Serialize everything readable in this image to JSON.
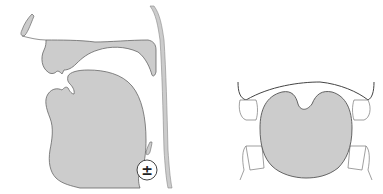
{
  "diagram": {
    "type": "phonetic-articulation",
    "panels": [
      {
        "id": "sagittal-section",
        "description": "Midsagittal view of vocal tract with velum, tongue, pharynx wall"
      },
      {
        "id": "coronal-section",
        "description": "Coronal view of tongue body between upper and lower molars"
      }
    ],
    "voicing_symbol": "±"
  },
  "colors": {
    "fill": "#cccccc",
    "stroke": "#555555",
    "background": "#ffffff"
  }
}
